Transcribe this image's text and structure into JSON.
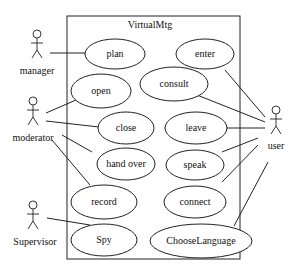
{
  "diagram": {
    "type": "uml-use-case",
    "system": {
      "name": "VirtualMtg"
    },
    "actors": [
      {
        "id": "manager",
        "label": "manager"
      },
      {
        "id": "moderator",
        "label": "moderator"
      },
      {
        "id": "supervisor",
        "label": "Supervisor"
      },
      {
        "id": "user",
        "label": "user"
      }
    ],
    "use_cases": [
      {
        "id": "plan",
        "label": "plan"
      },
      {
        "id": "enter",
        "label": "enter"
      },
      {
        "id": "open",
        "label": "open"
      },
      {
        "id": "consult",
        "label": "consult"
      },
      {
        "id": "close",
        "label": "close"
      },
      {
        "id": "leave",
        "label": "leave"
      },
      {
        "id": "handover",
        "label": "hand over"
      },
      {
        "id": "speak",
        "label": "speak"
      },
      {
        "id": "record",
        "label": "record"
      },
      {
        "id": "connect",
        "label": "connect"
      },
      {
        "id": "spy",
        "label": "Spy"
      },
      {
        "id": "chooselanguage",
        "label": "ChooseLanguage"
      }
    ],
    "associations": [
      [
        "manager",
        "plan"
      ],
      [
        "moderator",
        "open"
      ],
      [
        "moderator",
        "close"
      ],
      [
        "moderator",
        "handover"
      ],
      [
        "moderator",
        "record"
      ],
      [
        "supervisor",
        "spy"
      ],
      [
        "user",
        "enter"
      ],
      [
        "user",
        "consult"
      ],
      [
        "user",
        "leave"
      ],
      [
        "user",
        "speak"
      ],
      [
        "user",
        "connect"
      ],
      [
        "user",
        "chooselanguage"
      ]
    ]
  }
}
